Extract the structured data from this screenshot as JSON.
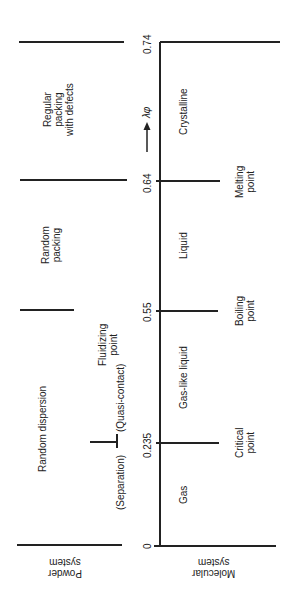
{
  "axis": {
    "variable": "λφ",
    "ticks": [
      "0",
      "0.235",
      "0.55",
      "0.64",
      "0.74"
    ]
  },
  "powder_system": {
    "label_line1": "Powder",
    "label_line2": "system",
    "regions": {
      "random_dispersion": "Random dispersion",
      "separation": "(Separation)",
      "quasi_contact": "(Quasi-contact)",
      "fluidizing_line1": "Fluidizing",
      "fluidizing_line2": "point",
      "random_packing_line1": "Random",
      "random_packing_line2": "packing",
      "regular_line1": "Regular",
      "regular_line2": "packing",
      "regular_line3": "with defects"
    }
  },
  "molecular_system": {
    "label_line1": "Molecular",
    "label_line2": "system",
    "regions": {
      "gas": "Gas",
      "gas_like_liquid": "Gas-like liquid",
      "liquid": "Liquid",
      "crystalline": "Crystalline"
    },
    "points": {
      "critical_line1": "Critical",
      "critical_line2": "point",
      "boiling_line1": "Boiling",
      "boiling_line2": "point",
      "melting_line1": "Melting",
      "melting_line2": "point"
    }
  }
}
